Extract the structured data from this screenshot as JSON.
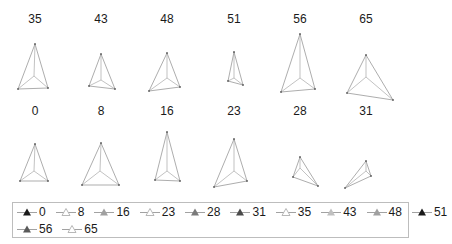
{
  "chart_data": {
    "type": "small-multiples-triangle-glyph",
    "title": "",
    "panels": [
      {
        "label": "35",
        "top": [
          35,
          44
        ],
        "left": [
          18,
          89
        ],
        "right": [
          48,
          88
        ],
        "center": [
          34,
          76
        ]
      },
      {
        "label": "43",
        "top": [
          101,
          54
        ],
        "left": [
          89,
          86
        ],
        "right": [
          115,
          89
        ],
        "center": [
          101,
          80
        ]
      },
      {
        "label": "48",
        "top": [
          167,
          53
        ],
        "left": [
          149,
          91
        ],
        "right": [
          180,
          87
        ],
        "center": [
          167,
          78
        ]
      },
      {
        "label": "51",
        "top": [
          234,
          52
        ],
        "left": [
          228,
          81
        ],
        "right": [
          243,
          85
        ],
        "center": [
          234,
          78
        ]
      },
      {
        "label": "56",
        "top": [
          300,
          34
        ],
        "left": [
          281,
          92
        ],
        "right": [
          315,
          89
        ],
        "center": [
          300,
          78
        ]
      },
      {
        "label": "65",
        "top": [
          366,
          55
        ],
        "left": [
          347,
          93
        ],
        "right": [
          393,
          100
        ],
        "center": [
          366,
          77
        ]
      },
      {
        "label": "0",
        "top": [
          35,
          144
        ],
        "left": [
          20,
          181
        ],
        "right": [
          48,
          181
        ],
        "center": [
          34,
          171
        ]
      },
      {
        "label": "8",
        "top": [
          101,
          143
        ],
        "left": [
          82,
          185
        ],
        "right": [
          119,
          185
        ],
        "center": [
          100,
          171
        ]
      },
      {
        "label": "16",
        "top": [
          167,
          132
        ],
        "left": [
          155,
          180
        ],
        "right": [
          180,
          181
        ],
        "center": [
          167,
          171
        ]
      },
      {
        "label": "23",
        "top": [
          234,
          139
        ],
        "left": [
          214,
          187
        ],
        "right": [
          247,
          181
        ],
        "center": [
          234,
          171
        ]
      },
      {
        "label": "28",
        "top": [
          300,
          157
        ],
        "left": [
          293,
          177
        ],
        "right": [
          318,
          186
        ],
        "center": [
          300,
          168
        ]
      },
      {
        "label": "31",
        "top": [
          366,
          161
        ],
        "left": [
          345,
          188
        ],
        "right": [
          371,
          176
        ],
        "center": [
          366,
          171
        ]
      }
    ],
    "title_positions": [
      {
        "label": "35",
        "x": 35,
        "y": 23
      },
      {
        "label": "43",
        "x": 101,
        "y": 23
      },
      {
        "label": "48",
        "x": 167,
        "y": 23
      },
      {
        "label": "51",
        "x": 234,
        "y": 23
      },
      {
        "label": "56",
        "x": 300,
        "y": 23
      },
      {
        "label": "65",
        "x": 366,
        "y": 23
      },
      {
        "label": "0",
        "x": 35,
        "y": 115
      },
      {
        "label": "8",
        "x": 101,
        "y": 115
      },
      {
        "label": "16",
        "x": 167,
        "y": 115
      },
      {
        "label": "23",
        "x": 234,
        "y": 115
      },
      {
        "label": "28",
        "x": 300,
        "y": 115
      },
      {
        "label": "31",
        "x": 366,
        "y": 115
      }
    ],
    "legend": {
      "position": "bottom",
      "rows": [
        [
          {
            "label": "0",
            "marker": "filled-triangle",
            "color": "#1a1a1a"
          },
          {
            "label": "8",
            "marker": "open-triangle",
            "color": "#b0b0b0"
          },
          {
            "label": "16",
            "marker": "filled-triangle",
            "color": "#a0a0a0"
          },
          {
            "label": "23",
            "marker": "open-triangle",
            "color": "#b0b0b0"
          },
          {
            "label": "28",
            "marker": "filled-triangle",
            "color": "#7a7a7a"
          },
          {
            "label": "31",
            "marker": "filled-triangle",
            "color": "#4a4a4a"
          },
          {
            "label": "35",
            "marker": "open-triangle",
            "color": "#b0b0b0"
          },
          {
            "label": "43",
            "marker": "filled-triangle",
            "color": "#c0c0c0"
          },
          {
            "label": "48",
            "marker": "filled-triangle",
            "color": "#a0a0a0"
          },
          {
            "label": "51",
            "marker": "filled-triangle",
            "color": "#1a1a1a"
          }
        ],
        [
          {
            "label": "56",
            "marker": "filled-triangle",
            "color": "#5a5a5a"
          },
          {
            "label": "65",
            "marker": "open-triangle",
            "color": "#b0b0b0"
          }
        ]
      ]
    },
    "grid": false,
    "axes": false
  }
}
